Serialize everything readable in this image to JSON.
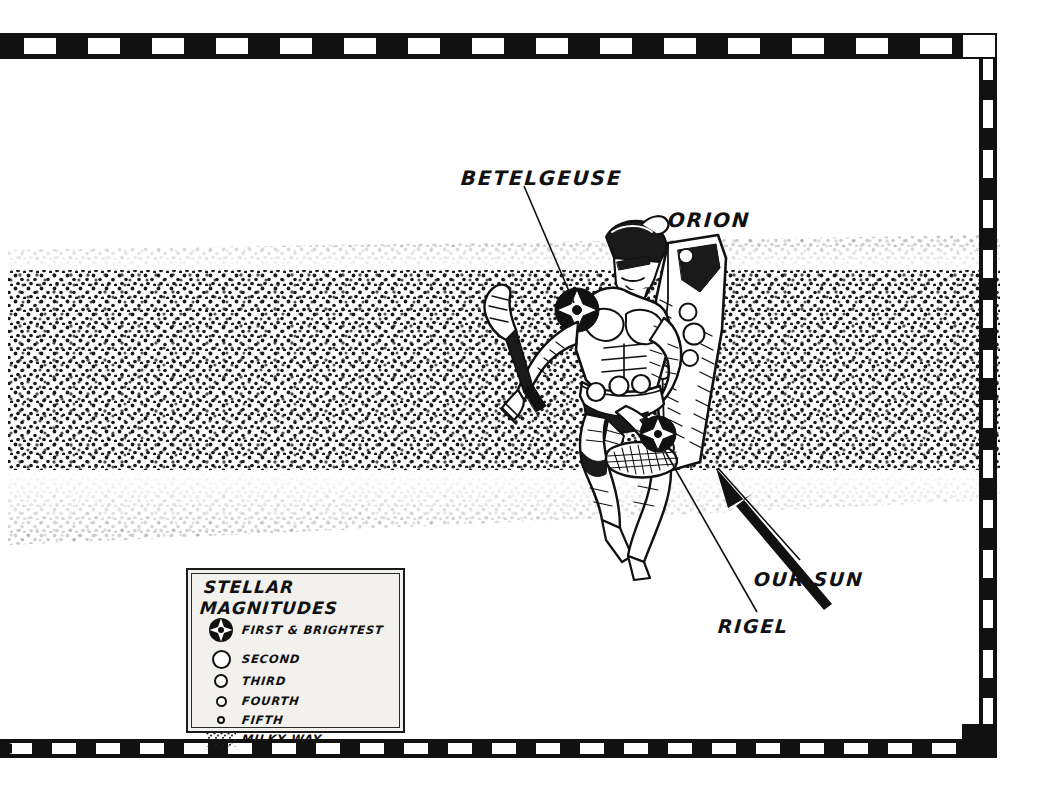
{
  "figure": {
    "subject": "Orion",
    "style": "stippled pen-and-ink star chart",
    "border_style": "checkered-dashed-frame"
  },
  "labels": [
    {
      "id": "betelgeuse",
      "text": "BETELGEUSE",
      "points_to": "shoulder star of Orion"
    },
    {
      "id": "orion",
      "text": "ORION",
      "points_to": "the warrior figure"
    },
    {
      "id": "our_sun",
      "text": "OUR SUN",
      "points_to": "arrow toward galactic position"
    },
    {
      "id": "rigel",
      "text": "RIGEL",
      "points_to": "foot star of Orion"
    }
  ],
  "legend": {
    "title_line_1": "STELLAR",
    "title_line_2": "MAGNITUDES",
    "entries": [
      {
        "symbol": "first-magnitude-star",
        "label": "FIRST & BRIGHTEST",
        "size_px": 24
      },
      {
        "symbol": "second-magnitude-circle",
        "label": "SECOND",
        "size_px": 19
      },
      {
        "symbol": "third-magnitude-circle",
        "label": "THIRD",
        "size_px": 14
      },
      {
        "symbol": "fourth-magnitude-circle",
        "label": "FOURTH",
        "size_px": 11
      },
      {
        "symbol": "fifth-magnitude-circle",
        "label": "FIFTH",
        "size_px": 8
      },
      {
        "symbol": "milky-way-stipple",
        "label": "MILKY WAY",
        "size_px": 26
      }
    ]
  },
  "colors": {
    "ink": "#111111",
    "paper": "#ffffff",
    "legend_paper": "#f2f1ee"
  }
}
